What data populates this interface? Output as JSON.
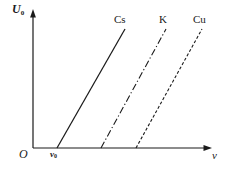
{
  "figure": {
    "background_color": "#ffffff",
    "ink_color": "#1a1a1a",
    "width": 229,
    "height": 174
  },
  "axes": {
    "y_label": "U",
    "y_label_subscript": "0",
    "x_label": "ν",
    "origin_label": "O",
    "x_tick_label": "ν",
    "x_tick_subscript": "0",
    "x_tick_value_x": 57,
    "arrowheads": "both-axes",
    "grid": "none"
  },
  "chart_data": {
    "type": "line",
    "title": "",
    "subtitle": "",
    "xlabel": "ν",
    "ylabel": "U₀",
    "xlim": [
      0,
      1
    ],
    "ylim": [
      0,
      1
    ],
    "grid": false,
    "legend_position": "above-line-ends",
    "annotations": [
      {
        "text": "ν₀",
        "x": 57,
        "y": 148,
        "note": "threshold frequency tick for Cs"
      }
    ],
    "series": [
      {
        "name": "Cs",
        "label": "Cs",
        "linestyle": "solid",
        "color": "#1a1a1a",
        "threshold_x": 57,
        "points": [
          {
            "x": 57,
            "y": 148
          },
          {
            "x": 125,
            "y": 29
          }
        ]
      },
      {
        "name": "K",
        "label": "K",
        "linestyle": "dashdot",
        "color": "#1a1a1a",
        "threshold_x": 101,
        "points": [
          {
            "x": 101,
            "y": 148
          },
          {
            "x": 166,
            "y": 29
          }
        ]
      },
      {
        "name": "Cu",
        "label": "Cu",
        "linestyle": "dashed",
        "color": "#1a1a1a",
        "threshold_x": 136,
        "points": [
          {
            "x": 136,
            "y": 148
          },
          {
            "x": 202,
            "y": 29
          }
        ]
      }
    ]
  }
}
